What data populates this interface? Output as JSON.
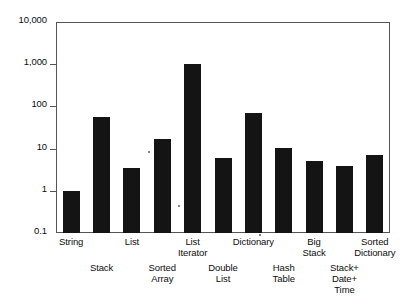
{
  "chart_data": {
    "type": "bar",
    "title": "",
    "subtitle": "",
    "xlabel": "",
    "ylabel": "",
    "yscale": "log",
    "ylim": [
      0.1,
      10000
    ],
    "grid": false,
    "legend": null,
    "ytick_labels": [
      "10,000",
      "1,000",
      "100",
      "10",
      "1",
      "0.1"
    ],
    "ytick_values": [
      10000,
      1000,
      100,
      10,
      1,
      0.1
    ],
    "categories": [
      "String",
      "Stack",
      "List",
      "Sorted Array",
      "List Iterator",
      "Double List",
      "Dictionary",
      "Hash Table",
      "Big Stack",
      "Stack+ Date+ Time",
      "Sorted Dictionary"
    ],
    "category_label_lines": [
      "String",
      "Stack",
      "List",
      "Sorted\nArray",
      "List\nIterator",
      "Double\nList",
      "Dictionary",
      "Hash\nTable",
      "Big\nStack",
      "Stack+\nDate+\nTime",
      "Sorted\nDictionary"
    ],
    "label_rows": [
      0,
      1,
      0,
      1,
      0,
      1,
      0,
      1,
      0,
      1,
      0
    ],
    "values": [
      1,
      57,
      3.5,
      16.5,
      1000,
      6,
      68,
      10.5,
      5,
      3.9,
      7.2
    ],
    "bar_color": "#141414",
    "axis_color": "#555555",
    "background_color": "#ffffff"
  }
}
